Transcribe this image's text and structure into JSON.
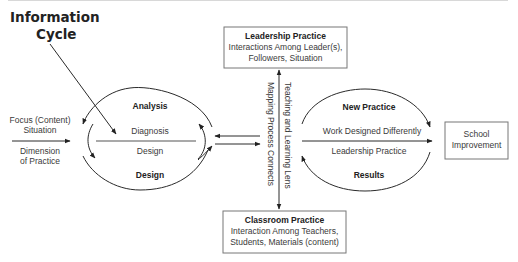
{
  "title": {
    "line1": "Information",
    "line2": "Cycle"
  },
  "left_input": {
    "above_arrow": [
      "Focus (Content)",
      "Situation"
    ],
    "below_arrow": [
      "Dimension",
      "of Practice"
    ]
  },
  "left_cycle": {
    "top_label": "Analysis",
    "upper_inner": "Diagnosis",
    "lower_inner": "Design",
    "bottom_label": "Design"
  },
  "center": {
    "top_box": {
      "title": "Leadership Practice",
      "line1": "Interactions Among Leader(s),",
      "line2": "Followers, Situation"
    },
    "bottom_box": {
      "title": "Classroom Practice",
      "line1": "Interaction Among Teachers,",
      "line2": "Students, Materials (content)"
    },
    "vertical_left": "Mapping Process Connects",
    "vertical_right": "Teaching and Learning Lens"
  },
  "right_cycle": {
    "top_label": "New Practice",
    "upper_inner": "Work Designed Differently",
    "lower_inner": "Leadership Practice",
    "bottom_label": "Results"
  },
  "outcome_box": {
    "line1": "School",
    "line2": "Improvement"
  }
}
